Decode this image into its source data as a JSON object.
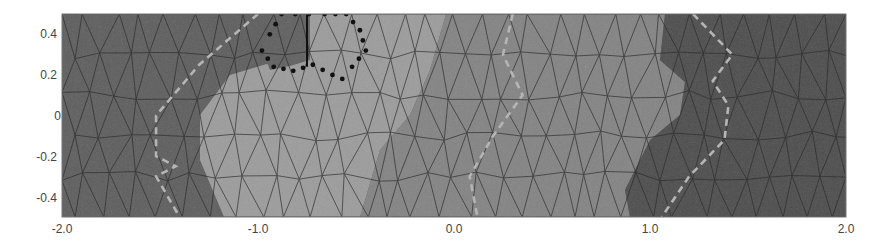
{
  "chart_data": {
    "type": "heatmap",
    "title": "",
    "xlabel": "",
    "ylabel": "",
    "xlim": [
      -2.0,
      2.0
    ],
    "ylim": [
      -0.5,
      0.5
    ],
    "grid": false,
    "legend": null,
    "x_ticks": [
      "-2.0",
      "-1.0",
      "0.0",
      "1.0",
      "2.0"
    ],
    "x_tick_values": [
      -2.0,
      -1.0,
      0.0,
      1.0,
      2.0
    ],
    "y_ticks": [
      "0.4",
      "0.2",
      "0",
      "-0.2",
      "-0.4"
    ],
    "y_tick_values": [
      0.4,
      0.2,
      0.0,
      -0.2,
      -0.4
    ],
    "regions": [
      {
        "name": "left-dark",
        "shade": "#5a5a5a",
        "approx_x_range": [
          -2.0,
          -1.05
        ]
      },
      {
        "name": "center-light",
        "shade": "#9a9a9a",
        "approx_x_range": [
          -1.25,
          -0.1
        ]
      },
      {
        "name": "center-mid",
        "shade": "#808080",
        "approx_x_range": [
          -0.2,
          0.9
        ]
      },
      {
        "name": "right-dark",
        "shade": "#4a4a4a",
        "approx_x_range": [
          0.9,
          2.0
        ]
      }
    ],
    "dashed_curves": [
      {
        "name": "interface-1",
        "color": "#b0b0b0",
        "points": [
          [
            -1.0,
            0.5
          ],
          [
            -1.3,
            0.25
          ],
          [
            -1.52,
            0.0
          ],
          [
            -1.52,
            -0.2
          ],
          [
            -1.42,
            -0.25
          ],
          [
            -1.52,
            -0.3
          ],
          [
            -1.4,
            -0.5
          ]
        ]
      },
      {
        "name": "interface-2",
        "color": "#b0b0b0",
        "points": [
          [
            0.3,
            0.5
          ],
          [
            0.25,
            0.3
          ],
          [
            0.35,
            0.1
          ],
          [
            0.2,
            -0.1
          ],
          [
            0.08,
            -0.3
          ],
          [
            0.12,
            -0.5
          ]
        ]
      },
      {
        "name": "interface-3",
        "color": "#b0b0b0",
        "points": [
          [
            1.22,
            0.5
          ],
          [
            1.42,
            0.3
          ],
          [
            1.32,
            0.17
          ],
          [
            1.4,
            0.05
          ],
          [
            1.38,
            -0.12
          ],
          [
            1.2,
            -0.3
          ],
          [
            1.06,
            -0.5
          ]
        ]
      }
    ],
    "dotted_polygon": {
      "name": "subregion-boundary",
      "color": "#111111",
      "points": [
        [
          -0.88,
          0.5
        ],
        [
          -0.94,
          0.4
        ],
        [
          -0.98,
          0.32
        ],
        [
          -0.92,
          0.24
        ],
        [
          -0.82,
          0.22
        ],
        [
          -0.72,
          0.25
        ],
        [
          -0.62,
          0.2
        ],
        [
          -0.57,
          0.18
        ],
        [
          -0.52,
          0.24
        ],
        [
          -0.45,
          0.32
        ],
        [
          -0.48,
          0.42
        ],
        [
          -0.55,
          0.5
        ],
        [
          -0.66,
          0.5
        ],
        [
          -0.74,
          0.5
        ]
      ]
    },
    "vertical_segment": {
      "x": -0.75,
      "y_range": [
        0.24,
        0.5
      ]
    }
  }
}
